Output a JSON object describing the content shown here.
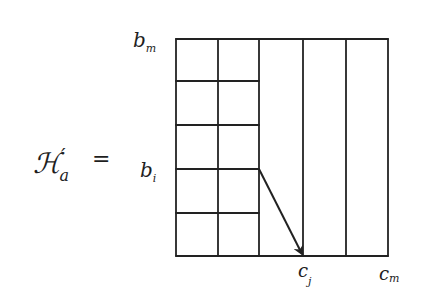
{
  "equation": {
    "lhs_symbol": "ℋ",
    "lhs_prime": "′",
    "lhs_subscript": "a",
    "equals": "="
  },
  "labels": {
    "row_top": {
      "base": "b",
      "sub": "m"
    },
    "row_i": {
      "base": "b",
      "sub": "i"
    },
    "col_j": {
      "base": "c",
      "sub": "j"
    },
    "col_m": {
      "base": "c",
      "sub": "m"
    }
  },
  "grid": {
    "columns": 5,
    "subdivided_columns": 2,
    "rows_in_subdivided_columns": 5,
    "line_color": "#222222"
  },
  "arrow": {
    "from": "b_i row boundary at right edge of subdivided block",
    "to": "c_j column bottom",
    "color": "#222222"
  }
}
